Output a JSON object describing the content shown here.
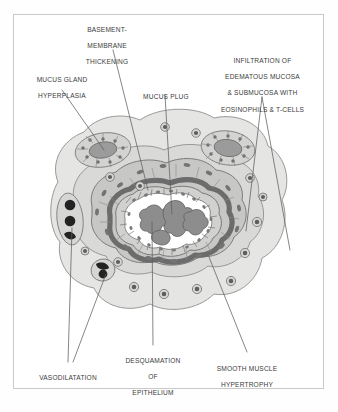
{
  "figure": {
    "border_color": "#c9c9c9",
    "background_color": "#ffffff",
    "leader_line_color": "#5a5a5a",
    "text_color": "#3b3b3b"
  },
  "labels": [
    {
      "id": "basement-membrane-thickening",
      "lines": [
        "BASEMENT-",
        "MEMBRANE",
        "THICKENING"
      ],
      "position": "top-center-left",
      "x": 64,
      "y": 18,
      "w": 86,
      "align": "center"
    },
    {
      "id": "mucus-gland-hyperplasia",
      "lines": [
        "MUCUS GLAND",
        "HYPERPLASIA"
      ],
      "position": "top-left",
      "x": 20,
      "y": 68,
      "w": 84,
      "align": "center"
    },
    {
      "id": "mucus-plug",
      "lines": [
        "MUCUS PLUG"
      ],
      "position": "top-center",
      "x": 134,
      "y": 85,
      "w": 64,
      "align": "center"
    },
    {
      "id": "infiltration-edematous-mucosa",
      "lines": [
        "INFILTRATION OF",
        "EDEMATOUS MUCOSA",
        "& SUBMUCOSA WITH",
        "EOSINOPHILS & T-CELLS"
      ],
      "position": "top-right",
      "x": 205,
      "y": 49,
      "w": 115,
      "align": "center"
    },
    {
      "id": "vasodilatation",
      "lines": [
        "VASODILATATION"
      ],
      "position": "bottom-left",
      "x": 28,
      "y": 366,
      "w": 80,
      "align": "center"
    },
    {
      "id": "desquamation-of-epithelium",
      "lines": [
        "DESQUAMATION",
        "OF",
        "EPITHELIUM"
      ],
      "position": "bottom-center",
      "x": 113,
      "y": 349,
      "w": 80,
      "align": "center"
    },
    {
      "id": "smooth-muscle-hypertrophy",
      "lines": [
        "SMOOTH MUSCLE",
        "HYPERTROPHY"
      ],
      "position": "bottom-right",
      "x": 203,
      "y": 357,
      "w": 88,
      "align": "center"
    }
  ],
  "anatomy": {
    "layers": [
      {
        "id": "adventitia",
        "name": "outer adventitia / submucosa",
        "fill": "#e2e2e0",
        "stroke": "#8e8e8e"
      },
      {
        "id": "submucosa-edema",
        "name": "edematous submucosa",
        "fill": "#dcdcda",
        "stroke": "#909090"
      },
      {
        "id": "smooth-muscle",
        "name": "hypertrophied smooth muscle",
        "fill": "#c6c6c4",
        "stroke": "#7c7c7c"
      },
      {
        "id": "basement-membrane",
        "name": "thickened basement membrane",
        "fill": "#6e6e6e",
        "stroke": "#555555"
      },
      {
        "id": "epithelium",
        "name": "desquamating epithelium",
        "fill": "#cfcfcd",
        "stroke": "#6f6f6f"
      },
      {
        "id": "lumen",
        "name": "narrowed airway lumen",
        "fill": "#ffffff",
        "stroke": "#6f6f6f"
      },
      {
        "id": "mucus-plug",
        "name": "mucus plug in lumen",
        "fill": "#8c8c8c",
        "stroke": "#5e5e5e"
      }
    ],
    "features": [
      {
        "id": "mucus-gland-left",
        "name": "hyperplastic mucus gland (left)",
        "fill": "#9a9a9a"
      },
      {
        "id": "mucus-gland-right",
        "name": "hyperplastic mucus gland (right)",
        "fill": "#9a9a9a"
      },
      {
        "id": "vessel-upper",
        "name": "dilated blood vessel (upper)",
        "fill": "#262626"
      },
      {
        "id": "vessel-lower",
        "name": "dilated blood vessel (lower)",
        "fill": "#262626"
      },
      {
        "id": "inflammatory-cells",
        "name": "eosinophils and T-cells",
        "fill": "#6b6b6b",
        "count": 14
      }
    ]
  }
}
